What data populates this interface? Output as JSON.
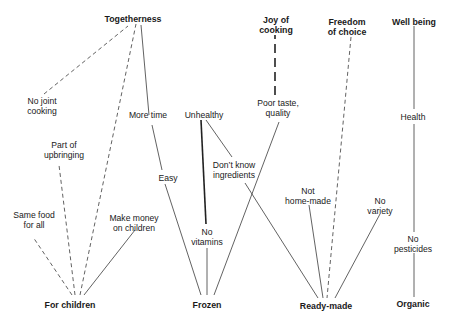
{
  "diagram": {
    "type": "means-end chain / laddering map",
    "top_values": [
      {
        "id": "togetherness",
        "label": "Togetherness"
      },
      {
        "id": "joy_of_cooking",
        "label": "Joy of\ncooking"
      },
      {
        "id": "freedom_of_choice",
        "label": "Freedom\nof choice"
      },
      {
        "id": "well_being",
        "label": "Well being"
      }
    ],
    "consequences": [
      {
        "id": "no_joint_cooking",
        "label": "No joint\ncooking"
      },
      {
        "id": "part_of_upbringing",
        "label": "Part of\nupbringing"
      },
      {
        "id": "same_food_for_all",
        "label": "Same food\nfor all"
      },
      {
        "id": "make_money_on_children",
        "label": "Make money\non children"
      },
      {
        "id": "more_time",
        "label": "More time"
      },
      {
        "id": "easy",
        "label": "Easy"
      },
      {
        "id": "unhealthy",
        "label": "Unhealthy"
      },
      {
        "id": "no_vitamins",
        "label": "No\nvitamins"
      },
      {
        "id": "dont_know_ingredients",
        "label": "Don’t know\ningredients"
      },
      {
        "id": "poor_taste_quality",
        "label": "Poor taste,\nquality"
      },
      {
        "id": "not_home_made",
        "label": "Not\nhome-made"
      },
      {
        "id": "no_variety",
        "label": "No\nvariety"
      },
      {
        "id": "health",
        "label": "Health"
      },
      {
        "id": "no_pesticides",
        "label": "No\npesticides"
      }
    ],
    "attributes": [
      {
        "id": "for_children",
        "label": "For children"
      },
      {
        "id": "frozen",
        "label": "Frozen"
      },
      {
        "id": "ready_made",
        "label": "Ready-made"
      },
      {
        "id": "organic",
        "label": "Organic"
      }
    ],
    "links": [
      {
        "from": "for_children",
        "to": "same_food_for_all",
        "style": "dashed"
      },
      {
        "from": "for_children",
        "to": "part_of_upbringing",
        "style": "dashed"
      },
      {
        "from": "for_children",
        "to": "togetherness",
        "style": "dashed"
      },
      {
        "from": "for_children",
        "to": "make_money_on_children",
        "style": "solid"
      },
      {
        "from": "no_joint_cooking",
        "to": "togetherness",
        "style": "dashed"
      },
      {
        "from": "more_time",
        "to": "togetherness",
        "style": "solid"
      },
      {
        "from": "more_time",
        "to": "easy",
        "style": "solid"
      },
      {
        "from": "easy",
        "to": "frozen",
        "style": "solid"
      },
      {
        "from": "unhealthy",
        "to": "no_vitamins",
        "style": "thick"
      },
      {
        "from": "unhealthy",
        "to": "dont_know_ingredients",
        "style": "solid"
      },
      {
        "from": "no_vitamins",
        "to": "frozen",
        "style": "solid"
      },
      {
        "from": "poor_taste_quality",
        "to": "frozen",
        "style": "solid"
      },
      {
        "from": "poor_taste_quality",
        "to": "joy_of_cooking",
        "style": "thick-dashed"
      },
      {
        "from": "dont_know_ingredients",
        "to": "ready_made",
        "style": "solid"
      },
      {
        "from": "not_home_made",
        "to": "ready_made",
        "style": "solid"
      },
      {
        "from": "freedom_of_choice",
        "to": "ready_made",
        "style": "dashed"
      },
      {
        "from": "no_variety",
        "to": "ready_made",
        "style": "solid"
      },
      {
        "from": "well_being",
        "to": "health",
        "style": "solid"
      },
      {
        "from": "health",
        "to": "no_pesticides",
        "style": "solid"
      },
      {
        "from": "no_pesticides",
        "to": "organic",
        "style": "solid"
      }
    ]
  },
  "labels": {
    "togetherness": "Togetherness",
    "joy_l1": "Joy of",
    "joy_l2": "cooking",
    "freedom_l1": "Freedom",
    "freedom_l2": "of choice",
    "well_being": "Well being",
    "no_joint_l1": "No joint",
    "no_joint_l2": "cooking",
    "part_l1": "Part of",
    "part_l2": "upbringing",
    "same_l1": "Same food",
    "same_l2": "for all",
    "money_l1": "Make money",
    "money_l2": "on children",
    "more_time": "More time",
    "easy": "Easy",
    "unhealthy": "Unhealthy",
    "novit_l1": "No",
    "novit_l2": "vitamins",
    "dk_l1": "Don’t know",
    "dk_l2": "ingredients",
    "poor_l1": "Poor taste,",
    "poor_l2": "quality",
    "nhm_l1": "Not",
    "nhm_l2": "home-made",
    "novar_l1": "No",
    "novar_l2": "variety",
    "health": "Health",
    "nopest_l1": "No",
    "nopest_l2": "pesticides",
    "for_children": "For children",
    "frozen": "Frozen",
    "ready_made": "Ready-made",
    "organic": "Organic"
  }
}
